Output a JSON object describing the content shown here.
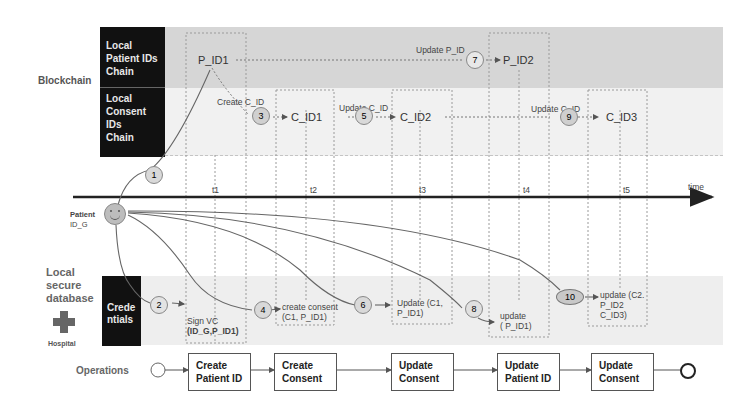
{
  "lanes": {
    "blockchain_label": "Blockchain",
    "patient_chain": "Local Patient IDs Chain",
    "patient_chain_lines": [
      "Local",
      "Patient IDs",
      "Chain"
    ],
    "consent_chain_lines": [
      "Local",
      "Consent IDs",
      "Chain"
    ],
    "db_label_lines": [
      "Local",
      "secure",
      "database"
    ],
    "hospital_label": "Hospital",
    "credentials_lines": [
      "Crede",
      "ntials"
    ],
    "operations_label": "Operations"
  },
  "patient": {
    "label_line1": "Patient",
    "label_line2": "ID_G"
  },
  "time_axis": {
    "label": "time",
    "ticks": [
      "t1",
      "t2",
      "t3",
      "t4",
      "t5"
    ]
  },
  "chain_nodes": {
    "p_id1": "P_ID1",
    "p_id2": "P_ID2",
    "c_id1": "C_ID1",
    "c_id2": "C_ID2",
    "c_id3": "C_ID3"
  },
  "chain_edges": {
    "create_c_id": "Create C_ID",
    "update_c_id_1": "Update C_ID",
    "update_p_id": "Update P_ID",
    "update_c_id_2": "Update C_ID"
  },
  "steps": [
    "1",
    "2",
    "3",
    "4",
    "5",
    "6",
    "7",
    "8",
    "9",
    "10"
  ],
  "db_entries": {
    "e1_line1": "Sign VC",
    "e1_line2": "(ID_G,P_ID1)",
    "e2_line1": "create consent",
    "e2_line2": "(C1, P_ID1)",
    "e3_line1": "Update  (C1,",
    "e3_line2": "P_ID1)",
    "e4_line1": "update",
    "e4_line2": "( P_ID1)",
    "e5_line1": "update (C2.",
    "e5_line2": "P_ID2",
    "e5_line3": "C_ID3)"
  },
  "operations": [
    {
      "line1": "Create",
      "line2": "Patient ID"
    },
    {
      "line1": "Create",
      "line2": "Consent"
    },
    {
      "line1": "Update",
      "line2": "Consent"
    },
    {
      "line1": "Update",
      "line2": "Patient ID"
    },
    {
      "line1": "Update",
      "line2": "Consent"
    }
  ],
  "colors": {
    "patient_band": "#d6d6d6",
    "consent_band": "#f1f1f1",
    "black_box": "#111111",
    "step_circle": "#d9d9d9"
  }
}
